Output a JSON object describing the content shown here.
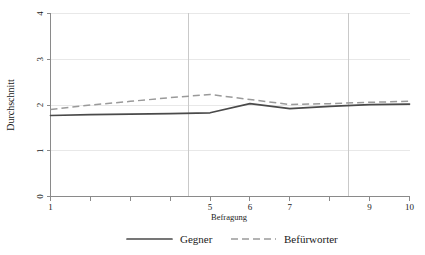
{
  "chart_data": {
    "type": "line",
    "title": "",
    "xlabel": "Befragung",
    "ylabel": "Durchschnitt",
    "xlim": [
      1,
      10
    ],
    "ylim": [
      0,
      4
    ],
    "grid": true,
    "legend_position": "bottom",
    "x": [
      1,
      2,
      3,
      4,
      5,
      6,
      7,
      8,
      9,
      10
    ],
    "xticks": [
      1,
      2,
      3,
      4,
      5,
      6,
      7,
      8,
      9,
      10
    ],
    "xticklabels": [
      "1",
      "",
      "",
      "",
      "5",
      "6",
      "7",
      "",
      "9",
      "10"
    ],
    "yticks": [
      0,
      1,
      2,
      3,
      4
    ],
    "yticklabels": [
      "0",
      "1",
      "2",
      "3",
      "4"
    ],
    "reference_lines": [
      4.46,
      8.47
    ],
    "series": [
      {
        "name": "Gegner",
        "style": "solid",
        "color": "#4a4a4a",
        "values": [
          1.77,
          1.79,
          1.8,
          1.81,
          1.83,
          2.03,
          1.92,
          1.97,
          2.01,
          2.02
        ]
      },
      {
        "name": "Befürworter",
        "style": "dashed",
        "color": "#9a9a9a",
        "values": [
          1.9,
          2.0,
          2.08,
          2.16,
          2.23,
          2.12,
          2.01,
          2.03,
          2.06,
          2.08
        ]
      }
    ]
  },
  "legend": {
    "items": [
      {
        "label": "Gegner"
      },
      {
        "label": "Befürworter"
      }
    ]
  },
  "axes": {
    "y_axis_title": "Durchschnitt",
    "x_axis_title": "Befragung"
  },
  "colors": {
    "gegner": "#4a4a4a",
    "befuerworter": "#9a9a9a",
    "axis": "#8a8a8a",
    "grid": "#e8e8e8",
    "reference": "#c9c9c9",
    "background": "#ffffff"
  }
}
